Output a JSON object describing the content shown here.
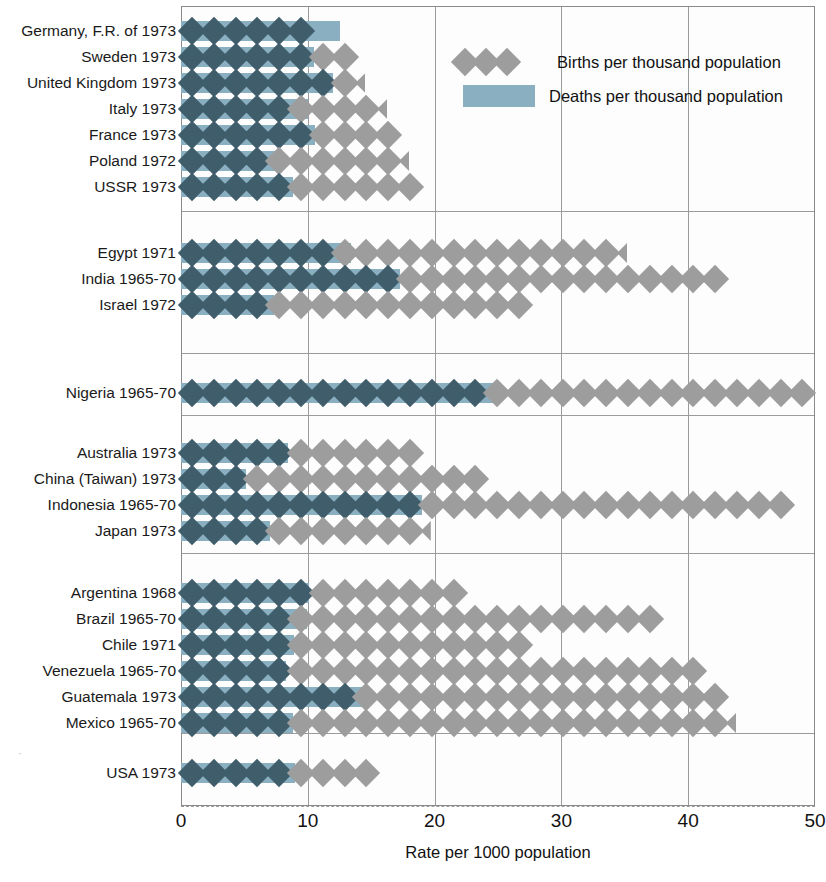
{
  "chart_data": {
    "type": "bar",
    "title": "",
    "xlabel": "Rate per 1000 population",
    "ylabel": "",
    "xlim": [
      0,
      50
    ],
    "xticks": [
      0,
      10,
      20,
      30,
      40,
      50
    ],
    "grid": true,
    "legend_position": "top-right",
    "legend": [
      {
        "key": "births",
        "label": "Births per thousand population",
        "marker": "diamond",
        "color": "#9d9d9d"
      },
      {
        "key": "deaths",
        "label": "Deaths per thousand population",
        "marker": "bar",
        "color": "#8aafc0"
      }
    ],
    "series": [
      {
        "name": "Births per thousand population",
        "values": [
          10.3,
          13.5,
          13.9,
          16.0,
          16.4,
          17.4,
          17.8,
          34.9,
          42.8,
          27.0,
          49.6,
          18.6,
          23.4,
          47.5,
          19.4,
          22.4,
          37.8,
          27.5,
          41.0,
          42.8,
          43.4,
          14.9
        ]
      },
      {
        "name": "Deaths per thousand population",
        "values": [
          12.5,
          10.5,
          12.0,
          10.0,
          10.6,
          8.0,
          8.8,
          13.4,
          17.3,
          7.3,
          24.9,
          8.4,
          5.1,
          19.0,
          7.0,
          10.1,
          9.9,
          8.9,
          8.3,
          14.9,
          8.8,
          9.0
        ]
      }
    ],
    "groups": [
      {
        "name": "Europe / USSR",
        "rows": [
          {
            "label": "Germany, F.R. of 1973",
            "births": 10.3,
            "deaths": 12.5
          },
          {
            "label": "Sweden 1973",
            "births": 13.5,
            "deaths": 10.5
          },
          {
            "label": "United Kingdom 1973",
            "births": 13.9,
            "deaths": 12.0
          },
          {
            "label": "Italy 1973",
            "births": 16.0,
            "deaths": 10.0
          },
          {
            "label": "France 1973",
            "births": 16.4,
            "deaths": 10.6
          },
          {
            "label": "Poland 1972",
            "births": 17.4,
            "deaths": 8.0
          },
          {
            "label": "USSR 1973",
            "births": 17.8,
            "deaths": 8.8
          }
        ]
      },
      {
        "name": "Near East / South Asia",
        "rows": [
          {
            "label": "Egypt 1971",
            "births": 34.9,
            "deaths": 13.4
          },
          {
            "label": "India 1965-70",
            "births": 42.8,
            "deaths": 17.3
          },
          {
            "label": "Israel 1972",
            "births": 27.0,
            "deaths": 7.3
          }
        ]
      },
      {
        "name": "Africa",
        "rows": [
          {
            "label": "Nigeria 1965-70",
            "births": 49.6,
            "deaths": 24.9
          }
        ]
      },
      {
        "name": "East Asia / Oceania",
        "rows": [
          {
            "label": "Australia 1973",
            "births": 18.6,
            "deaths": 8.4
          },
          {
            "label": "China (Taiwan) 1973",
            "births": 23.4,
            "deaths": 5.1
          },
          {
            "label": "Indonesia 1965-70",
            "births": 47.5,
            "deaths": 19.0
          },
          {
            "label": "Japan 1973",
            "births": 19.4,
            "deaths": 7.0
          }
        ]
      },
      {
        "name": "Latin America",
        "rows": [
          {
            "label": "Argentina 1968",
            "births": 22.4,
            "deaths": 10.1
          },
          {
            "label": "Brazil 1965-70",
            "births": 37.8,
            "deaths": 9.9
          },
          {
            "label": "Chile 1971",
            "births": 27.5,
            "deaths": 8.9
          },
          {
            "label": "Venezuela 1965-70",
            "births": 41.0,
            "deaths": 8.3
          },
          {
            "label": "Guatemala 1973",
            "births": 42.8,
            "deaths": 14.9
          },
          {
            "label": "Mexico 1965-70",
            "births": 43.4,
            "deaths": 8.8
          }
        ]
      },
      {
        "name": "North America",
        "rows": [
          {
            "label": "USA 1973",
            "births": 14.9,
            "deaths": 9.0
          }
        ]
      }
    ]
  },
  "axis": {
    "tick_labels": [
      "0",
      "10",
      "20",
      "30",
      "40",
      "50"
    ],
    "title": "Rate per 1000 population"
  },
  "legend": {
    "births_label": "Births per thousand population",
    "deaths_label": "Deaths per thousand population"
  },
  "colors": {
    "births_marker": "#9d9d9d",
    "births_marker_over_bar": "#3f5d6b",
    "deaths_bar": "#8aafc0",
    "grid": "#9b9b9b",
    "text": "#1a1a1a"
  }
}
